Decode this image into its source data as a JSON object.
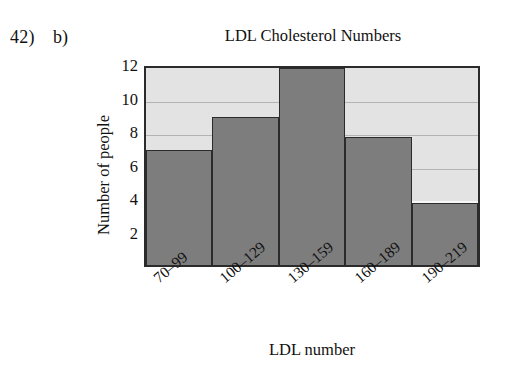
{
  "worksheet": {
    "question_number": "42)",
    "part_label": "b)"
  },
  "chart_data": {
    "type": "bar",
    "title": "LDL Cholesterol Numbers",
    "xlabel": "LDL number",
    "ylabel": "Number of people",
    "categories": [
      "70–99",
      "100–129",
      "130–159",
      "160–189",
      "190–219"
    ],
    "values": [
      7,
      9,
      12,
      7.8,
      3.8
    ],
    "ylim": [
      0,
      12
    ],
    "yticks": [
      "2",
      "4",
      "6",
      "8",
      "10",
      "12"
    ],
    "ytick_values": [
      2,
      4,
      6,
      8,
      10,
      12
    ],
    "grid": true,
    "legend": false,
    "colors": {
      "bar_fill": "#7d7d7d",
      "bar_edge": "#2b2b2b",
      "plot_background": "#e3e3e3",
      "gridline": "#b3b3b3",
      "axis": "#2b2b2b",
      "text": "#111111",
      "page_background": "#ffffff"
    }
  }
}
